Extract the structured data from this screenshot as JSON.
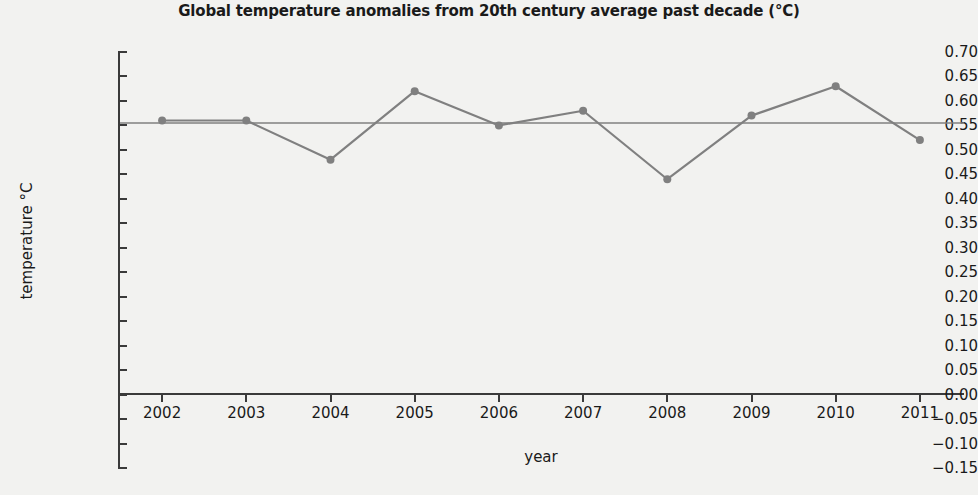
{
  "chart_data": {
    "type": "line",
    "title": "Global  temperature anomalies from 20th century average past decade (°C)",
    "xlabel": "year",
    "ylabel": "temperature °C",
    "categories": [
      "2002",
      "2003",
      "2004",
      "2005",
      "2006",
      "2007",
      "2008",
      "2009",
      "2010",
      "2011"
    ],
    "x": [
      2002,
      2003,
      2004,
      2005,
      2006,
      2007,
      2008,
      2009,
      2010,
      2011
    ],
    "values": [
      0.56,
      0.56,
      0.48,
      0.62,
      0.55,
      0.58,
      0.44,
      0.57,
      0.63,
      0.52
    ],
    "series": [
      {
        "name": "temperature anomaly",
        "values": [
          0.56,
          0.56,
          0.48,
          0.62,
          0.55,
          0.58,
          0.44,
          0.57,
          0.63,
          0.52
        ],
        "color": "#808080",
        "marker": "circle"
      }
    ],
    "reference_line": {
      "name": "decade average",
      "value": 0.555,
      "color": "#808080"
    },
    "ylim": [
      -0.15,
      0.7
    ],
    "ytick_step": 0.05,
    "ytick_labels": [
      "0.70",
      "0.65",
      "0.60",
      "0.55",
      "0.50",
      "0.45",
      "0.40",
      "0.35",
      "0.30",
      "0.25",
      "0.20",
      "0.15",
      "0.10",
      "0.05",
      "0.00",
      "−0.05",
      "−0.10",
      "−0.15"
    ],
    "ytick_values": [
      0.7,
      0.65,
      0.6,
      0.55,
      0.5,
      0.45,
      0.4,
      0.35,
      0.3,
      0.25,
      0.2,
      0.15,
      0.1,
      0.05,
      0.0,
      -0.05,
      -0.1,
      -0.15
    ],
    "grid": false,
    "legend": "none",
    "background_color": "#f2f2f0",
    "axis_color": "#3a3a3a",
    "text_color": "#1a1a1a"
  }
}
